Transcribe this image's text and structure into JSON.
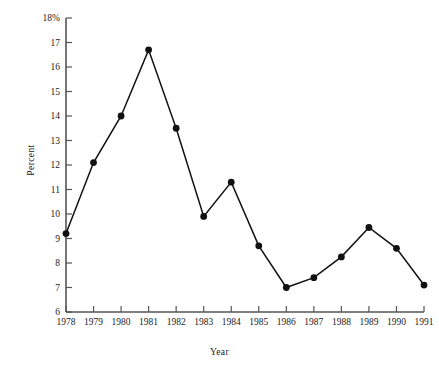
{
  "chart_data": {
    "type": "line",
    "title": "",
    "xlabel": "Year",
    "ylabel": "Percent",
    "grid": false,
    "legend": "none",
    "xlim": [
      1978,
      1991
    ],
    "ylim": [
      6,
      18
    ],
    "ytick_labels": [
      "18%",
      "17",
      "16",
      "15",
      "14",
      "13",
      "12",
      "11",
      "10",
      "9",
      "8",
      "7",
      "6"
    ],
    "ytick_values": [
      18,
      17,
      16,
      15,
      14,
      13,
      12,
      11,
      10,
      9,
      8,
      7,
      6
    ],
    "categories": [
      "1978",
      "1979",
      "1980",
      "1981",
      "1982",
      "1983",
      "1984",
      "1985",
      "1986",
      "1987",
      "1988",
      "1989",
      "1990",
      "1991"
    ],
    "x": [
      1978,
      1979,
      1980,
      1981,
      1982,
      1983,
      1984,
      1985,
      1986,
      1987,
      1988,
      1989,
      1990,
      1991
    ],
    "values": [
      9.2,
      12.1,
      14.0,
      16.7,
      13.5,
      9.9,
      11.3,
      8.7,
      7.0,
      7.4,
      8.25,
      9.45,
      8.6,
      7.1
    ],
    "series": [
      {
        "name": "Percent",
        "values": [
          9.2,
          12.1,
          14.0,
          16.7,
          13.5,
          9.9,
          11.3,
          8.7,
          7.0,
          7.4,
          8.25,
          9.45,
          8.6,
          7.1
        ]
      }
    ],
    "line_color": "#111111",
    "marker": "circle-filled",
    "marker_color": "#111111",
    "axis_color": "#555555"
  }
}
